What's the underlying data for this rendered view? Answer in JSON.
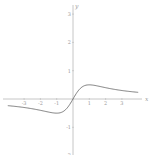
{
  "chart_data": {
    "type": "line",
    "title": "",
    "xlabel": "x",
    "ylabel": "y",
    "function": "x/(1+x^2)",
    "xlim": [
      -4.2,
      4.2
    ],
    "ylim": [
      -1.9,
      3.5
    ],
    "x_ticks": [
      -3,
      -2,
      -1,
      1,
      2,
      3
    ],
    "y_ticks": [
      3,
      2,
      1,
      -1,
      -2
    ],
    "grid": false,
    "legend": null,
    "series": [
      {
        "name": "f(x)",
        "x": [
          -4,
          -3,
          -2,
          -1.5,
          -1,
          -0.5,
          0,
          0.5,
          1,
          1.5,
          2,
          3,
          4
        ],
        "y": [
          -0.235,
          -0.3,
          -0.4,
          -0.462,
          -0.5,
          -0.4,
          0,
          0.4,
          0.5,
          0.462,
          0.4,
          0.3,
          0.235
        ]
      }
    ],
    "colors": {
      "axis": "#b0b0b0",
      "curve": "#707070",
      "labels": "#9a9a9a"
    }
  },
  "axes": {
    "x_label": "x",
    "y_label": "y",
    "x_tick_labels": [
      "-3",
      "-2",
      "-1",
      "1",
      "2",
      "3"
    ],
    "y_tick_labels": [
      "3",
      "2",
      "1",
      "-1",
      "-2"
    ]
  }
}
